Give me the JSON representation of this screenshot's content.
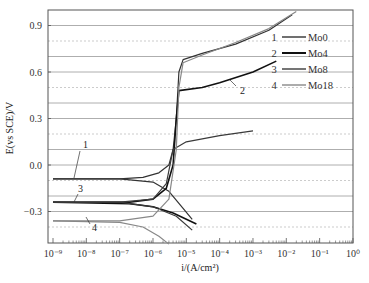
{
  "chart_data": {
    "type": "line",
    "title": "",
    "xlabel": "i/(A/cm²)",
    "ylabel": "E(vs SCE)/V",
    "xscale": "log",
    "xlim": [
      1e-09,
      1
    ],
    "ylim": [
      -0.52,
      1.0
    ],
    "x_tick_labels": [
      "10⁻⁹",
      "10⁻⁸",
      "10⁻⁷",
      "10⁻⁶",
      "10⁻⁵",
      "10⁻⁴",
      "10⁻³",
      "10⁻²",
      "10⁻¹",
      "10⁰"
    ],
    "y_tick_labels": [
      "0.9",
      "0.6",
      "0.3",
      "0.0",
      "−0.3"
    ],
    "y_ticks": [
      0.9,
      0.6,
      0.3,
      0.0,
      -0.3
    ],
    "grid": {
      "solid_major": true,
      "dashed_minor": true
    },
    "legend_position": "upper right",
    "legend": [
      {
        "num": "1",
        "name": "Mo0"
      },
      {
        "num": "2",
        "name": "Mo4"
      },
      {
        "num": "3",
        "name": "Mo8"
      },
      {
        "num": "4",
        "name": "Mo18"
      }
    ],
    "series": [
      {
        "name": "Mo0",
        "label": "1",
        "color": "#333333",
        "corrosion_potential": -0.09,
        "anodic": [
          [
            1e-09,
            -0.09
          ],
          [
            1e-07,
            -0.09
          ],
          [
            5e-07,
            -0.08
          ],
          [
            1.5e-06,
            -0.05
          ],
          [
            3e-06,
            0.0
          ],
          [
            4e-06,
            0.1
          ],
          [
            5e-06,
            0.3
          ],
          [
            6e-06,
            0.6
          ],
          [
            8e-06,
            0.68
          ],
          [
            3e-05,
            0.72
          ],
          [
            0.0003,
            0.78
          ],
          [
            0.003,
            0.87
          ],
          [
            0.015,
            0.97
          ]
        ],
        "cathodic": [
          [
            1e-09,
            -0.09
          ],
          [
            1e-07,
            -0.09
          ],
          [
            1e-06,
            -0.11
          ],
          [
            3e-06,
            -0.17
          ],
          [
            8e-06,
            -0.28
          ],
          [
            1.5e-05,
            -0.35
          ]
        ]
      },
      {
        "name": "Mo4",
        "label": "2",
        "color": "#111111",
        "corrosion_potential": -0.24,
        "anodic": [
          [
            1e-09,
            -0.24
          ],
          [
            2e-07,
            -0.24
          ],
          [
            1e-06,
            -0.22
          ],
          [
            2.5e-06,
            -0.15
          ],
          [
            4e-06,
            0.0
          ],
          [
            5e-06,
            0.3
          ],
          [
            6e-06,
            0.48
          ],
          [
            3e-05,
            0.5
          ],
          [
            0.0001,
            0.53
          ],
          [
            0.001,
            0.6
          ],
          [
            0.005,
            0.67
          ]
        ],
        "cathodic": [
          [
            1e-09,
            -0.24
          ],
          [
            2e-07,
            -0.25
          ],
          [
            1e-06,
            -0.27
          ],
          [
            4e-06,
            -0.31
          ],
          [
            2e-05,
            -0.38
          ]
        ]
      },
      {
        "name": "Mo8",
        "label": "3",
        "color": "#3a3a3a",
        "corrosion_potential": -0.24,
        "anodic": [
          [
            1e-09,
            -0.24
          ],
          [
            1e-07,
            -0.24
          ],
          [
            1e-06,
            -0.22
          ],
          [
            2.5e-06,
            -0.12
          ],
          [
            4e-06,
            0.1
          ],
          [
            1e-05,
            0.15
          ],
          [
            0.0001,
            0.19
          ],
          [
            0.001,
            0.22
          ]
        ],
        "cathodic": [
          [
            1e-09,
            -0.24
          ],
          [
            1e-07,
            -0.24
          ],
          [
            1e-06,
            -0.27
          ],
          [
            5e-06,
            -0.33
          ],
          [
            1.5e-05,
            -0.42
          ]
        ]
      },
      {
        "name": "Mo18",
        "label": "4",
        "color": "#888888",
        "corrosion_potential": -0.36,
        "anodic": [
          [
            1e-09,
            -0.36
          ],
          [
            1e-07,
            -0.36
          ],
          [
            1e-06,
            -0.33
          ],
          [
            3e-06,
            -0.22
          ],
          [
            5e-06,
            0.1
          ],
          [
            6e-06,
            0.5
          ],
          [
            8e-06,
            0.66
          ],
          [
            3e-05,
            0.71
          ],
          [
            0.0003,
            0.79
          ],
          [
            0.003,
            0.88
          ],
          [
            0.02,
            0.99
          ]
        ],
        "cathodic": [
          [
            1e-09,
            -0.36
          ],
          [
            1e-07,
            -0.37
          ],
          [
            5e-07,
            -0.4
          ],
          [
            1.5e-06,
            -0.46
          ],
          [
            3e-06,
            -0.51
          ]
        ]
      }
    ]
  }
}
